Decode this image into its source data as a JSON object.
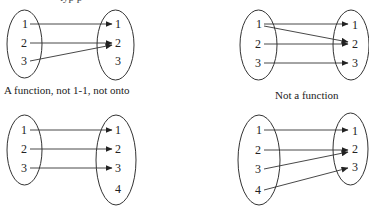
{
  "top_cutoff_text": "typ p",
  "panels": [
    {
      "id": "top-left",
      "caption": "A function, not 1-1, not onto",
      "domain": [
        "1",
        "2",
        "3"
      ],
      "codomain": [
        "1",
        "2",
        "3"
      ],
      "mappings": [
        [
          "1",
          "1"
        ],
        [
          "2",
          "2"
        ],
        [
          "3",
          "2"
        ]
      ]
    },
    {
      "id": "top-right",
      "caption": "Not a function",
      "domain": [
        "1",
        "2",
        "3"
      ],
      "codomain": [
        "1",
        "2",
        "3"
      ],
      "mappings": [
        [
          "1",
          "1"
        ],
        [
          "1",
          "2"
        ],
        [
          "2",
          "2"
        ],
        [
          "3",
          "3"
        ]
      ]
    },
    {
      "id": "bottom-left",
      "caption": "",
      "domain": [
        "1",
        "2",
        "3"
      ],
      "codomain": [
        "1",
        "2",
        "3",
        "4"
      ],
      "mappings": [
        [
          "1",
          "1"
        ],
        [
          "2",
          "2"
        ],
        [
          "3",
          "3"
        ]
      ]
    },
    {
      "id": "bottom-right",
      "caption": "",
      "domain": [
        "1",
        "2",
        "3",
        "4"
      ],
      "codomain": [
        "1",
        "2",
        "3"
      ],
      "mappings": [
        [
          "1",
          "1"
        ],
        [
          "2",
          "2"
        ],
        [
          "3",
          "2"
        ],
        [
          "4",
          "3"
        ]
      ]
    }
  ],
  "colors": {
    "line": "#333333",
    "text": "#222222",
    "background": "#ffffff"
  }
}
